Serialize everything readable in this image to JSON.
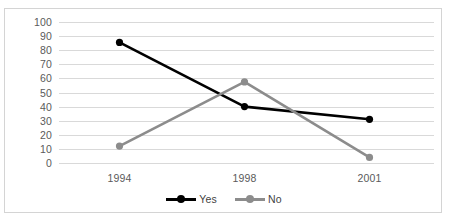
{
  "chart_data": {
    "type": "line",
    "title": "",
    "subtitle": "",
    "xlabel": "",
    "ylabel": "",
    "categories": [
      "1994",
      "1998",
      "2001"
    ],
    "series": [
      {
        "name": "Yes",
        "color": "#000000",
        "values": [
          85.5,
          40,
          31
        ]
      },
      {
        "name": "No",
        "color": "#8c8c8c",
        "values": [
          12,
          57.5,
          4
        ]
      }
    ],
    "ylim": [
      0,
      100
    ],
    "y_ticks": [
      100,
      90,
      80,
      70,
      60,
      50,
      40,
      30,
      20,
      10,
      0
    ],
    "y_tick_labels": [
      "100",
      "90",
      "80",
      "70",
      "60",
      "50",
      "40",
      "30",
      "20",
      "10",
      "0"
    ],
    "grid": {
      "horizontal": true,
      "vertical": false,
      "color": "#d9d9d9"
    },
    "legend": {
      "position": "bottom-center",
      "orientation": "horizontal",
      "entries": [
        {
          "label": "Yes",
          "color": "#000000"
        },
        {
          "label": "No",
          "color": "#8c8c8c"
        }
      ]
    },
    "markers": {
      "shape": "circle",
      "visible": true
    },
    "frame": {
      "border": true,
      "border_color": "#d4d4d4"
    }
  }
}
